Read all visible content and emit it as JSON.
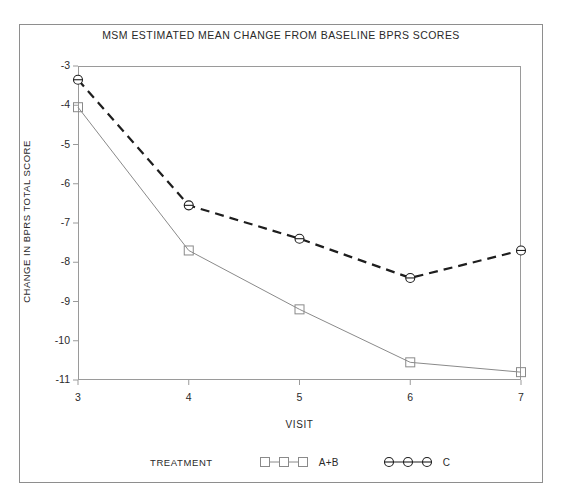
{
  "chart_data": {
    "type": "line",
    "title": "MSM ESTIMATED MEAN CHANGE FROM BASELINE BPRS SCORES",
    "xlabel": "VISIT",
    "ylabel": "CHANGE IN BPRS TOTAL SCORE",
    "x": [
      3,
      4,
      5,
      6,
      7
    ],
    "xtick_labels": [
      "3",
      "4",
      "5",
      "6",
      "7"
    ],
    "ytick_labels": [
      "-3",
      "-4",
      "-5",
      "-6",
      "-7",
      "-8",
      "-9",
      "-10",
      "-11"
    ],
    "yticks": [
      -3,
      -4,
      -5,
      -6,
      -7,
      -8,
      -9,
      -10,
      -11
    ],
    "xlim": [
      3,
      7
    ],
    "ylim": [
      -11,
      -3
    ],
    "grid": false,
    "legend_position": "bottom",
    "legend_title": "TREATMENT",
    "series": [
      {
        "name": "A+B",
        "values": [
          -4.05,
          -7.7,
          -9.2,
          -10.55,
          -10.8
        ],
        "line_style": "solid",
        "marker": "square",
        "color": "#8a8a8a"
      },
      {
        "name": "C",
        "values": [
          -3.35,
          -6.55,
          -7.4,
          -8.4,
          -7.7
        ],
        "line_style": "dashed",
        "marker": "circle",
        "color": "#1e1e1e"
      }
    ]
  },
  "figure": {
    "frame_color": "#8e8e8e",
    "axis_color": "#9a9a9a",
    "text_color": "#2a2a2a"
  }
}
